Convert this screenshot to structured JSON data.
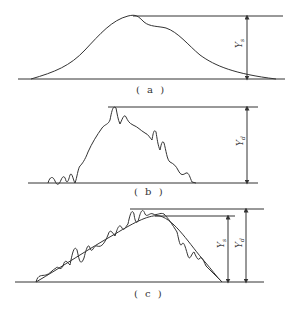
{
  "panels": [
    {
      "id": "a",
      "caption": "( a )",
      "label": "Y",
      "label_sub": "s"
    },
    {
      "id": "b",
      "caption": "( b )",
      "label": "Y",
      "label_sub": "d"
    },
    {
      "id": "c",
      "caption": "( c )",
      "labels": [
        {
          "label": "Y",
          "label_sub": "s"
        },
        {
          "label": "Y",
          "label_sub": "d"
        }
      ]
    }
  ],
  "colors": {
    "line": "#333333",
    "background": "#ffffff"
  }
}
